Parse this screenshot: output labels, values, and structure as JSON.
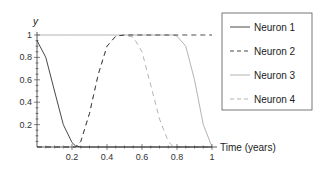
{
  "chart_data": {
    "type": "line",
    "title": "",
    "xlabel": "Time (years)",
    "ylabel": "y",
    "xlim": [
      0,
      1
    ],
    "ylim": [
      0,
      1
    ],
    "x_ticks": [
      "0.2",
      "0.4",
      "0.6",
      "0.8",
      "1"
    ],
    "y_ticks": [
      "0.2",
      "0.4",
      "0.6",
      "0.8",
      "1"
    ],
    "grid": false,
    "legend_position": "right",
    "x": [
      0,
      0.05,
      0.1,
      0.15,
      0.2,
      0.22,
      0.25,
      0.3,
      0.35,
      0.4,
      0.45,
      0.5,
      0.55,
      0.6,
      0.65,
      0.7,
      0.75,
      0.78,
      0.8,
      0.85,
      0.9,
      0.95,
      1.0
    ],
    "series": [
      {
        "name": "Neuron 1",
        "style": "solid",
        "color": "#333333",
        "values": [
          0.95,
          0.8,
          0.5,
          0.2,
          0.04,
          0.01,
          0,
          0,
          0,
          0,
          0,
          0,
          0,
          0,
          0,
          0,
          0,
          0,
          0,
          0,
          0,
          0,
          0
        ]
      },
      {
        "name": "Neuron 2",
        "style": "dashed",
        "color": "#333333",
        "values": [
          0,
          0,
          0,
          0,
          0,
          0,
          0.05,
          0.3,
          0.65,
          0.9,
          0.99,
          1,
          1,
          1,
          1,
          1,
          1,
          1,
          1,
          1,
          1,
          1,
          1
        ]
      },
      {
        "name": "Neuron 3",
        "style": "solid",
        "color": "#aaaaaa",
        "values": [
          1,
          1,
          1,
          1,
          1,
          1,
          1,
          1,
          1,
          1,
          1,
          1,
          1,
          1,
          1,
          1,
          1,
          1,
          0.99,
          0.9,
          0.6,
          0.2,
          0
        ]
      },
      {
        "name": "Neuron 4",
        "style": "dashed",
        "color": "#aaaaaa",
        "values": [
          0,
          0,
          0,
          0,
          0,
          0,
          0.05,
          0.3,
          0.65,
          0.9,
          0.99,
          1,
          0.98,
          0.85,
          0.55,
          0.25,
          0.05,
          0,
          0,
          0,
          0,
          0,
          0
        ]
      }
    ]
  },
  "legend": {
    "items": [
      {
        "label": "Neuron 1"
      },
      {
        "label": "Neuron 2"
      },
      {
        "label": "Neuron 3"
      },
      {
        "label": "Neuron 4"
      }
    ]
  }
}
